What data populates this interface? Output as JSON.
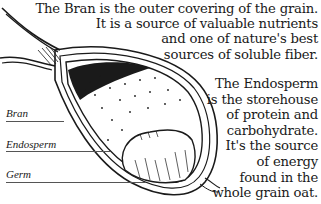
{
  "bran_description": {
    "lines": [
      "The Bran is the outer covering of the grain.",
      "It is a source of valuable nutrients",
      "and one of nature's best",
      "sources of soluble fiber."
    ]
  },
  "endosperm_description": {
    "lines": [
      "The Endosperm",
      "is the storehouse",
      "of protein and",
      "carbohydrate.",
      "It's the source",
      "of energy",
      "found in the",
      "whole grain oat."
    ]
  },
  "labels": {
    "bran": "Bran",
    "endosperm": "Endosperm",
    "germ": "Germ"
  },
  "colors": {
    "ink": "#1a1a1a",
    "background": "#ffffff"
  }
}
